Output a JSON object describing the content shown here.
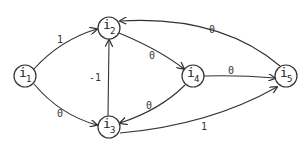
{
  "diagram": {
    "type": "directed-weighted-graph",
    "nodes": [
      {
        "id": "i1",
        "label": "i",
        "subscript": "1"
      },
      {
        "id": "i2",
        "label": "i",
        "subscript": "2"
      },
      {
        "id": "i3",
        "label": "i",
        "subscript": "3"
      },
      {
        "id": "i4",
        "label": "i",
        "subscript": "4"
      },
      {
        "id": "i5",
        "label": "i",
        "subscript": "5"
      }
    ],
    "edges": [
      {
        "from": "i1",
        "to": "i2",
        "weight": "1"
      },
      {
        "from": "i1",
        "to": "i3",
        "weight": "0"
      },
      {
        "from": "i3",
        "to": "i2",
        "weight": "-1"
      },
      {
        "from": "i2",
        "to": "i4",
        "weight": "0"
      },
      {
        "from": "i4",
        "to": "i3",
        "weight": "0"
      },
      {
        "from": "i4",
        "to": "i5",
        "weight": "0"
      },
      {
        "from": "i5",
        "to": "i2",
        "weight": "0"
      },
      {
        "from": "i3",
        "to": "i5",
        "weight": "1"
      }
    ],
    "colors": {
      "stroke": "#333333",
      "background": "#ffffff"
    }
  }
}
